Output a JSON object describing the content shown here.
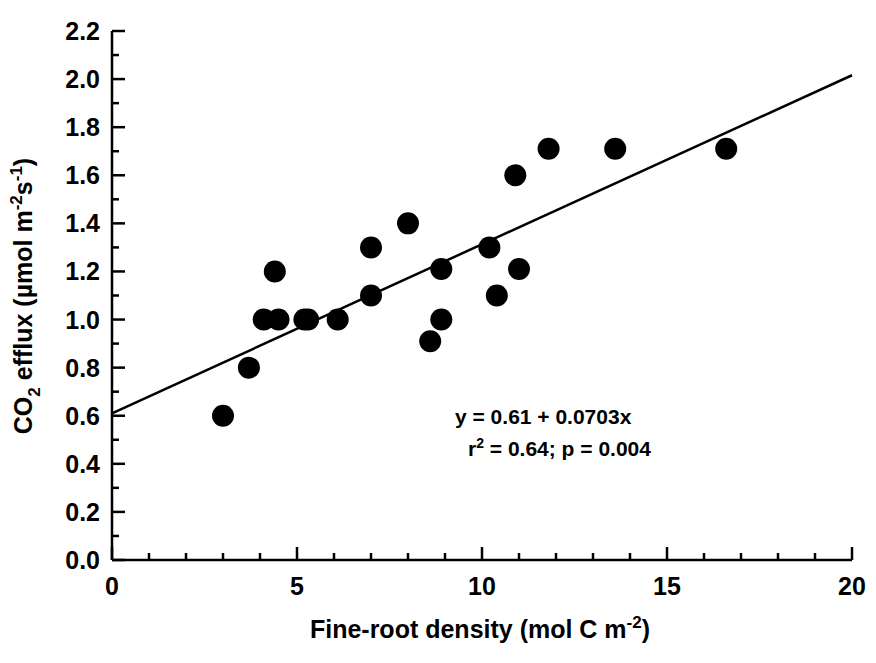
{
  "chart_data": {
    "type": "scatter",
    "title": "",
    "xlabel": "Fine-root density (mol C m-2)",
    "ylabel": "CO2 efflux (µmol m-2s-1)",
    "xlim": [
      0,
      20
    ],
    "ylim": [
      0.0,
      2.2
    ],
    "grid": false,
    "legend": null,
    "x_major_ticks": [
      0,
      5,
      10,
      15,
      20
    ],
    "x_major_tick_labels": [
      "0",
      "5",
      "10",
      "15",
      "20"
    ],
    "x_minor_tick_step": 1,
    "y_major_ticks": [
      0.0,
      0.2,
      0.4,
      0.6,
      0.8,
      1.0,
      1.2,
      1.4,
      1.6,
      1.8,
      2.0,
      2.2
    ],
    "y_major_tick_labels": [
      "0.0",
      "0.2",
      "0.4",
      "0.6",
      "0.8",
      "1.0",
      "1.2",
      "1.4",
      "1.6",
      "1.8",
      "2.0",
      "2.2"
    ],
    "y_minor_tick_step": 0.1,
    "marker": {
      "shape": "circle",
      "color": "#000000",
      "size": 11
    },
    "points": [
      {
        "x": 3.0,
        "y": 0.6
      },
      {
        "x": 3.7,
        "y": 0.8
      },
      {
        "x": 4.1,
        "y": 1.0
      },
      {
        "x": 4.5,
        "y": 1.0
      },
      {
        "x": 4.4,
        "y": 1.2
      },
      {
        "x": 5.2,
        "y": 1.0
      },
      {
        "x": 5.3,
        "y": 1.0
      },
      {
        "x": 6.1,
        "y": 1.0
      },
      {
        "x": 7.0,
        "y": 1.3
      },
      {
        "x": 7.0,
        "y": 1.1
      },
      {
        "x": 8.0,
        "y": 1.4
      },
      {
        "x": 8.6,
        "y": 0.91
      },
      {
        "x": 8.9,
        "y": 1.0
      },
      {
        "x": 8.9,
        "y": 1.21
      },
      {
        "x": 10.2,
        "y": 1.3
      },
      {
        "x": 10.4,
        "y": 1.1
      },
      {
        "x": 10.9,
        "y": 1.6
      },
      {
        "x": 11.0,
        "y": 1.21
      },
      {
        "x": 11.8,
        "y": 1.71
      },
      {
        "x": 13.6,
        "y": 1.71
      },
      {
        "x": 16.6,
        "y": 1.71
      }
    ],
    "fit_line": {
      "intercept": 0.61,
      "slope": 0.0703,
      "x_start": 0,
      "x_end": 20,
      "color": "#000000",
      "width": 2.5
    },
    "annotations": {
      "equation": "y = 0.61 + 0.0703x",
      "stats_r2_prefix": "r",
      "stats_r2_sup": "2",
      "stats_rest": " = 0.64; p = 0.004"
    }
  },
  "axis_labels": {
    "x_title_main": "Fine-root density (mol C m",
    "x_title_sup": "-2",
    "x_title_tail": ")",
    "y_title_lead": "CO",
    "y_title_sub": "2",
    "y_title_mid": " efflux (µmol m",
    "y_title_sup1": "-2",
    "y_title_s": "s",
    "y_title_sup2": "-1",
    "y_title_tail": ")"
  }
}
